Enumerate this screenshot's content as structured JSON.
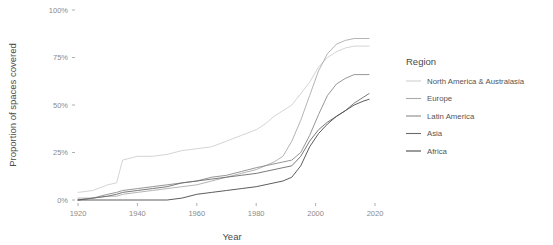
{
  "chart_data": {
    "type": "line",
    "title": "",
    "xlabel": "Year",
    "ylabel": "Proportion of spaces covered",
    "xlim": [
      1920,
      2020
    ],
    "ylim": [
      0,
      100
    ],
    "xticks": [
      1920,
      1940,
      1960,
      1980,
      2000,
      2020
    ],
    "xtick_labels": [
      "1920",
      "1940",
      "1960",
      "1980",
      "2000",
      "2020"
    ],
    "yticks": [
      0,
      25,
      50,
      75,
      100
    ],
    "ytick_labels": [
      "0%",
      "25%",
      "50%",
      "75%",
      "100%"
    ],
    "grid": false,
    "legend_position": "right",
    "legend_title": "Region",
    "x": [
      1920,
      1925,
      1930,
      1933,
      1935,
      1940,
      1945,
      1950,
      1955,
      1960,
      1965,
      1970,
      1975,
      1980,
      1983,
      1986,
      1989,
      1992,
      1995,
      1998,
      2001,
      2004,
      2007,
      2010,
      2013,
      2016,
      2018
    ],
    "series": [
      {
        "name": "North America & Australasia",
        "color": "#cfcfcf",
        "values": [
          4,
          5,
          8,
          9,
          21,
          23,
          23,
          24,
          26,
          27,
          28,
          31,
          34,
          37,
          40,
          44,
          47,
          50,
          56,
          62,
          70,
          75,
          78,
          80,
          81,
          81,
          81
        ]
      },
      {
        "name": "Europe",
        "color": "#ababab",
        "values": [
          1,
          1,
          2,
          2,
          3,
          4,
          5,
          6,
          7,
          8,
          10,
          12,
          14,
          16,
          18,
          20,
          23,
          31,
          42,
          55,
          68,
          77,
          82,
          84,
          85,
          85,
          85
        ]
      },
      {
        "name": "Latin America",
        "color": "#8a8a8a",
        "values": [
          0,
          1,
          3,
          4,
          5,
          6,
          7,
          8,
          9,
          10,
          12,
          13,
          15,
          17,
          18,
          19,
          20,
          21,
          25,
          34,
          45,
          55,
          61,
          64,
          66,
          66,
          66
        ]
      },
      {
        "name": "Asia",
        "color": "#6b6b6b",
        "values": [
          0,
          1,
          2,
          3,
          4,
          5,
          6,
          7,
          9,
          10,
          11,
          12,
          13,
          14,
          15,
          16,
          17,
          18,
          23,
          31,
          37,
          41,
          44,
          47,
          51,
          54,
          56
        ]
      },
      {
        "name": "Africa",
        "color": "#4a4a4a",
        "values": [
          0,
          0,
          0,
          0,
          0,
          0,
          0,
          0,
          1,
          3,
          4,
          5,
          6,
          7,
          8,
          9,
          10,
          12,
          18,
          28,
          35,
          40,
          44,
          47,
          50,
          52,
          53
        ]
      }
    ]
  },
  "legend": {
    "title": "Region",
    "items": [
      {
        "label": "North America & Australasia",
        "color": "#cfcfcf"
      },
      {
        "label": "Europe",
        "color": "#ababab"
      },
      {
        "label": "Latin America",
        "color": "#8a8a8a"
      },
      {
        "label": "Asia",
        "color": "#6b6b6b"
      },
      {
        "label": "Africa",
        "color": "#4a4a4a"
      }
    ]
  },
  "axes": {
    "x_title": "Year",
    "y_title": "Proportion of spaces covered"
  }
}
